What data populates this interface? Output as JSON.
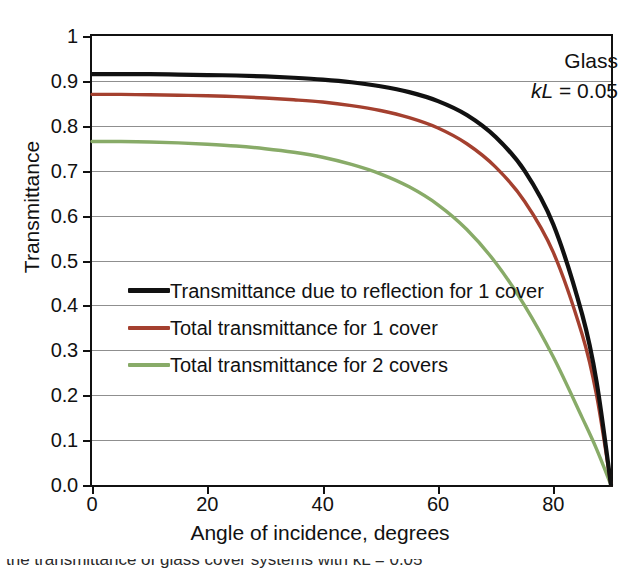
{
  "chart_data": {
    "type": "line",
    "title": "",
    "xlabel": "Angle of incidence, degrees",
    "ylabel": "Transmittance",
    "xlim": [
      0,
      90
    ],
    "ylim": [
      0,
      1
    ],
    "xticks": [
      "0",
      "20",
      "40",
      "60",
      "80"
    ],
    "xtick_values": [
      0,
      20,
      40,
      60,
      80
    ],
    "yticks": [
      "0.0",
      "0.1",
      "0.2",
      "0.3",
      "0.4",
      "0.5",
      "0.6",
      "0.7",
      "0.8",
      "0.9",
      "1"
    ],
    "ytick_values": [
      0,
      0.1,
      0.2,
      0.3,
      0.4,
      0.5,
      0.6,
      0.7,
      0.8,
      0.9,
      1.0
    ],
    "grid": true,
    "grid_axis": "y",
    "legend_position": "center-left inside axes",
    "annotations": [
      {
        "text": "Glass",
        "position": "top-right"
      },
      {
        "text": "kL = 0.05",
        "position": "top-right",
        "italic_prefix": "kL",
        "rest": " = 0.05"
      }
    ],
    "x": [
      0,
      5,
      10,
      15,
      20,
      25,
      30,
      35,
      40,
      45,
      50,
      55,
      60,
      65,
      70,
      75,
      80,
      85,
      87.5,
      90
    ],
    "series": [
      {
        "name": "Transmittance due to reflection for 1 cover",
        "color": "#111111",
        "values": [
          0.915,
          0.915,
          0.915,
          0.914,
          0.913,
          0.912,
          0.91,
          0.907,
          0.903,
          0.897,
          0.888,
          0.875,
          0.855,
          0.824,
          0.775,
          0.7,
          0.58,
          0.38,
          0.23,
          0.0
        ]
      },
      {
        "name": "Total transmittance for 1 cover",
        "color": "#a4402f",
        "values": [
          0.87,
          0.87,
          0.869,
          0.868,
          0.867,
          0.865,
          0.862,
          0.858,
          0.853,
          0.845,
          0.834,
          0.818,
          0.795,
          0.76,
          0.708,
          0.632,
          0.518,
          0.335,
          0.2,
          0.0
        ]
      },
      {
        "name": "Total transmittance for 2 covers",
        "color": "#88ab68",
        "values": [
          0.765,
          0.765,
          0.764,
          0.762,
          0.759,
          0.755,
          0.749,
          0.741,
          0.73,
          0.714,
          0.693,
          0.664,
          0.624,
          0.569,
          0.495,
          0.4,
          0.285,
          0.15,
          0.08,
          0.0
        ]
      }
    ]
  },
  "axes": {
    "y_title": "Transmittance",
    "x_title": "Angle of incidence, degrees"
  },
  "annotation": {
    "material": "Glass",
    "kl_symbol": "kL",
    "kl_value": " = 0.05"
  },
  "legend": {
    "items": [
      {
        "label": "Transmittance due to reflection for 1 cover",
        "color": "#111111"
      },
      {
        "label": "Total transmittance for 1 cover",
        "color": "#a4402f"
      },
      {
        "label": "Total transmittance for 2 covers",
        "color": "#88ab68"
      }
    ]
  },
  "caption": {
    "partial_line": "the transmittance of glass cover systems with kL = 0.05"
  }
}
